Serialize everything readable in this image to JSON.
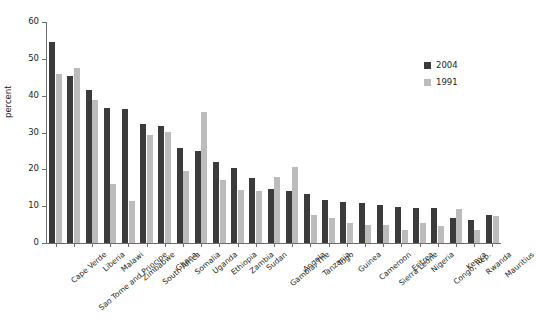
{
  "chart_data": {
    "type": "bar",
    "title": "",
    "subtitle": "",
    "xlabel": "",
    "ylabel": "percent",
    "ylim": [
      0,
      60
    ],
    "yticks": [
      0,
      10,
      20,
      30,
      40,
      50,
      60
    ],
    "grid": false,
    "legend_position": "top-right",
    "categories": [
      "Cape Verde",
      "Sao Tome and Principe",
      "Liberia",
      "Malawi",
      "Zimbabwe",
      "South Africa",
      "Ghana",
      "Somalia",
      "Uganda",
      "Ethiopia",
      "Zambia",
      "Sudan",
      "Gambia, The",
      "Angola",
      "Tanzania",
      "Togo",
      "Guinea",
      "Cameroon",
      "Sierra Leone",
      "Eritrea",
      "Nigeria",
      "Congo, Rep.",
      "Kenya",
      "Rwanda",
      "Mauritius"
    ],
    "series": [
      {
        "name": "2004",
        "color": "#3b3b3b",
        "values": [
          54.7,
          45.3,
          41.6,
          36.6,
          36.5,
          32.2,
          31.7,
          25.9,
          25.1,
          22.1,
          20.5,
          17.6,
          14.8,
          14.2,
          13.2,
          11.6,
          11.0,
          10.8,
          10.4,
          9.8,
          9.6,
          9.4,
          6.9,
          6.3,
          7.6
        ]
      },
      {
        "name": "1991",
        "color": "#bcbcbc",
        "values": [
          45.8,
          47.5,
          38.9,
          15.9,
          11.5,
          29.2,
          30.2,
          19.6,
          35.5,
          17.2,
          14.4,
          14.0,
          17.8,
          20.7,
          7.6,
          6.8,
          5.3,
          5.0,
          4.9,
          3.6,
          5.4,
          4.6,
          9.3,
          3.4,
          7.2
        ]
      }
    ]
  },
  "legend": {
    "items": [
      {
        "label": "2004",
        "color": "#3b3b3b"
      },
      {
        "label": "1991",
        "color": "#bcbcbc"
      }
    ]
  },
  "axis": {
    "y_title": "percent"
  }
}
